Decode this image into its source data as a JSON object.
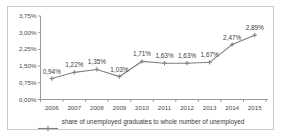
{
  "chart_data": {
    "type": "line",
    "title": "",
    "xlabel": "",
    "ylabel": "",
    "grid": false,
    "legend_position": "bottom",
    "ylim": [
      0,
      3.75
    ],
    "ytick_labels": [
      "0,00%",
      "0,75%",
      "1,50%",
      "2,25%",
      "3,00%",
      "3,75%"
    ],
    "ytick_values": [
      0,
      0.75,
      1.5,
      2.25,
      3,
      3.75
    ],
    "categories": [
      "2006",
      "2007",
      "2008",
      "2009",
      "2010",
      "2011",
      "2012",
      "2013",
      "2014",
      "2015"
    ],
    "series": [
      {
        "name": "share of unemployed graduates to whole number of unemployed",
        "values": [
          0.94,
          1.22,
          1.35,
          1.03,
          1.71,
          1.63,
          1.63,
          1.67,
          2.47,
          2.89
        ],
        "data_labels": [
          "0,94%",
          "1,22%",
          "1,35%",
          "1,03%",
          "1,71%",
          "1,63%",
          "1,63%",
          "1,67%",
          "2,47%",
          "2,89%"
        ],
        "color": "#808080",
        "marker": "cross"
      }
    ],
    "colors": {
      "line": "#808080",
      "axis": "#9a9a9a",
      "frame": "#c9c9c9",
      "text": "#3b3b3b",
      "background": "#ffffff"
    }
  }
}
